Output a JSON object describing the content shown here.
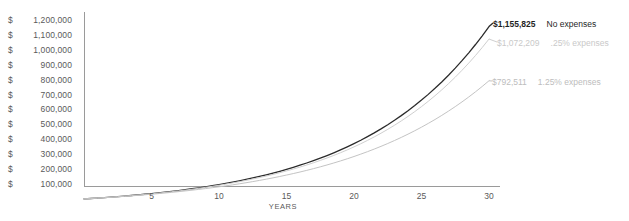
{
  "chart_data": {
    "type": "line",
    "title": "",
    "xlabel": "YEARS",
    "ylabel": "",
    "xlim": [
      0,
      30
    ],
    "ylim": [
      0,
      1200000
    ],
    "grid": false,
    "legend_position": "right-inline",
    "x": [
      0,
      1,
      2,
      3,
      4,
      5,
      6,
      7,
      8,
      9,
      10,
      11,
      12,
      13,
      14,
      15,
      16,
      17,
      18,
      19,
      20,
      21,
      22,
      23,
      24,
      25,
      26,
      27,
      28,
      29,
      30
    ],
    "y_ticks": [
      100000,
      200000,
      300000,
      400000,
      500000,
      600000,
      700000,
      800000,
      900000,
      1000000,
      1100000,
      1200000
    ],
    "y_tick_labels": [
      "$ 1,200,000",
      "$ 1,100,000",
      "$ 1,000,000",
      "$  900,000",
      "$  800,000",
      "$  700,000",
      "$  600,000",
      "$  500,000",
      "$  400,000",
      "$  300,000",
      "$  200,000",
      "$  100,000"
    ],
    "y_tick_labels_split": [
      {
        "cur": "$",
        "num": "1,200,000"
      },
      {
        "cur": "$",
        "num": "1,100,000"
      },
      {
        "cur": "$",
        "num": "1,000,000"
      },
      {
        "cur": "$",
        "num": "900,000"
      },
      {
        "cur": "$",
        "num": "800,000"
      },
      {
        "cur": "$",
        "num": "700,000"
      },
      {
        "cur": "$",
        "num": "600,000"
      },
      {
        "cur": "$",
        "num": "500,000"
      },
      {
        "cur": "$",
        "num": "400,000"
      },
      {
        "cur": "$",
        "num": "300,000"
      },
      {
        "cur": "$",
        "num": "200,000"
      },
      {
        "cur": "$",
        "num": "100,000"
      }
    ],
    "x_ticks": [
      5,
      10,
      15,
      20,
      25,
      30
    ],
    "x_tick_labels": [
      "5",
      "10",
      "15",
      "20",
      "25",
      "30"
    ],
    "series": [
      {
        "name": "No expenses",
        "color": "#2b2b2b",
        "end_label": "$1,155,825",
        "end_value": 1155825,
        "values": [
          0,
          25000,
          52000,
          81500,
          113800,
          149100,
          187800,
          230000,
          276300,
          326900,
          382300,
          442900,
          509400,
          582200,
          661900,
          749400,
          845000,
          949700,
          1064200,
          1189500,
          1326200,
          1475100,
          1637100,
          1813300,
          2004700,
          0,
          0,
          0,
          0,
          0,
          0
        ]
      },
      {
        "name": ".25% expenses",
        "color": "#cfcfcf",
        "end_label": "$1,072,209",
        "end_value": 1072209,
        "values": [
          0,
          24800,
          51300,
          80000,
          111200,
          145100,
          182100,
          222400,
          266300,
          314100,
          366200,
          423000,
          484800,
          552200,
          625500,
          705300,
          792000,
          886200,
          988500,
          1099500,
          1219900,
          1350500,
          1491900,
          1645000,
          1810700,
          0,
          0,
          0,
          0,
          0,
          0
        ]
      },
      {
        "name": "1.25% expenses",
        "color": "#c4c4c4",
        "end_label": "$792,511",
        "end_value": 792511,
        "values": [
          0,
          24100,
          49500,
          76300,
          104600,
          134400,
          165800,
          199000,
          233900,
          270700,
          309400,
          350100,
          393000,
          438100,
          485500,
          535400,
          587800,
          643000,
          701000,
          761900,
          826000,
          893300,
          964000,
          1038400,
          1116400,
          0,
          0,
          0,
          0,
          0,
          0
        ]
      }
    ],
    "annotations": [
      {
        "value_label": "$1,155,825",
        "legend_label": "No expenses"
      },
      {
        "value_label": "$1,072,209",
        "legend_label": ".25% expenses"
      },
      {
        "value_label": "$792,511",
        "legend_label": "1.25% expenses"
      }
    ],
    "axis_color": "#9a9a9a",
    "text_color": "#5a5a5a"
  }
}
